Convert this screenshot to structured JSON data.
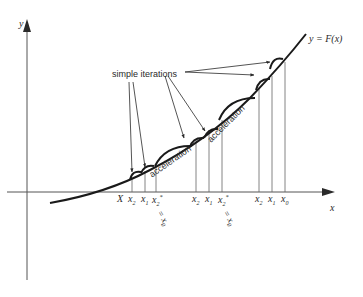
{
  "figure": {
    "axes": {
      "y_label": "y",
      "x_label": "x",
      "curve_label": "y = F(x)"
    },
    "annotations": {
      "simple_iterations": "simple iterations",
      "acceleration_1": "acceleration",
      "acceleration_2": "acceleration"
    },
    "x_ticks": {
      "root": "X",
      "group1": {
        "x2": "x",
        "x2_sub": "2",
        "x1": "x",
        "x1_sub": "1",
        "x2star": "x",
        "x2star_sub": "2",
        "x2star_sup": "*",
        "eq_x0": "= x",
        "eq_x0_sub": "0"
      },
      "group2": {
        "x2": "x",
        "x2_sub": "2",
        "x1": "x",
        "x1_sub": "1",
        "x2star": "x",
        "x2star_sub": "2",
        "x2star_sup": "*",
        "eq_x0": "= x",
        "eq_x0_sub": "0"
      },
      "group3": {
        "x2": "x",
        "x2_sub": "2",
        "x1": "x",
        "x1_sub": "1",
        "x0": "x",
        "x0_sub": "0"
      }
    }
  }
}
